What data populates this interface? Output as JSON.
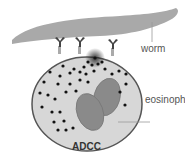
{
  "labels": {
    "worm": "worm",
    "eosinophil": "eosinophil",
    "caption": "ADCC"
  },
  "colors": {
    "worm": "#a9a9a9",
    "cell_fill": "#d7d7d7",
    "cell_border": "#555555",
    "nucleus": "#8a8a8a",
    "granule": "#111111",
    "antibody": "#444444",
    "receptor": "#aaaaaa"
  }
}
